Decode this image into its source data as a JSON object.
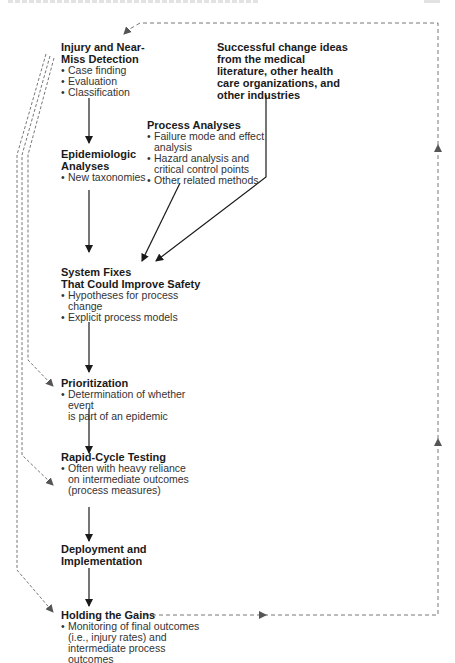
{
  "diagram": {
    "type": "flowchart",
    "nodes": {
      "injury_detection": {
        "title_line1": "Injury and Near-",
        "title_line2": "Miss Detection",
        "bullets": [
          "Case finding",
          "Evaluation",
          "Classification"
        ]
      },
      "change_ideas": {
        "lines": [
          "Successful change ideas",
          "from the medical",
          "literature, other health",
          "care organizations, and",
          "other industries"
        ]
      },
      "process_analyses": {
        "title": "Process Analyses",
        "bullets": [
          [
            "Failure mode and effect",
            "analysis"
          ],
          [
            "Hazard analysis and",
            "critical control points"
          ],
          [
            "Other related methods"
          ]
        ]
      },
      "epidemiologic": {
        "title_line1": "Epidemiologic",
        "title_line2": "Analyses",
        "bullets": [
          "New taxonomies"
        ]
      },
      "system_fixes": {
        "title_line1": "System Fixes",
        "title_line2": "That Could Improve Safety",
        "bullets": [
          [
            "Hypotheses for process",
            "change"
          ],
          [
            "Explicit process models"
          ]
        ]
      },
      "prioritization": {
        "title": "Prioritization",
        "bullets": [
          [
            "Determination of whether event",
            "is part of an epidemic"
          ]
        ]
      },
      "rapid_cycle": {
        "title": "Rapid-Cycle Testing",
        "bullets": [
          [
            "Often with heavy reliance",
            "on intermediate outcomes",
            "(process measures)"
          ]
        ]
      },
      "deployment": {
        "title_line1": "Deployment and",
        "title_line2": "Implementation"
      },
      "holding_gains": {
        "title": "Holding the Gains",
        "bullets": [
          [
            "Monitoring of final outcomes",
            "(i.e., injury rates) and",
            "intermediate process outcomes"
          ]
        ]
      }
    },
    "edges": [
      {
        "from": "injury_detection",
        "to": "epidemiologic",
        "style": "solid"
      },
      {
        "from": "epidemiologic",
        "to": "system_fixes",
        "style": "solid"
      },
      {
        "from": "process_analyses",
        "to": "system_fixes",
        "style": "solid"
      },
      {
        "from": "change_ideas",
        "to": "system_fixes",
        "style": "solid"
      },
      {
        "from": "system_fixes",
        "to": "prioritization",
        "style": "solid"
      },
      {
        "from": "prioritization",
        "to": "rapid_cycle",
        "style": "solid"
      },
      {
        "from": "rapid_cycle",
        "to": "deployment",
        "style": "solid"
      },
      {
        "from": "deployment",
        "to": "holding_gains",
        "style": "solid"
      },
      {
        "from": "injury_detection",
        "to": "prioritization",
        "style": "dashed"
      },
      {
        "from": "injury_detection",
        "to": "rapid_cycle",
        "style": "dashed"
      },
      {
        "from": "injury_detection",
        "to": "holding_gains",
        "style": "dashed"
      },
      {
        "from": "holding_gains",
        "to": "injury_detection",
        "style": "dashed",
        "route": "feedback loop via right edge"
      }
    ],
    "colors": {
      "solid_line": "#1a1a1a",
      "dashed_line": "#555555",
      "text": "#1a1a1a"
    }
  }
}
